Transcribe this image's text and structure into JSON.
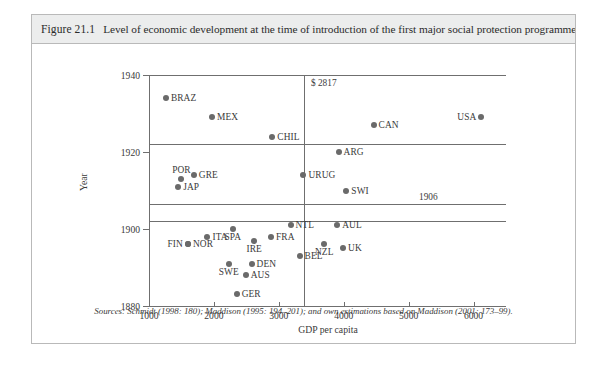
{
  "figure": {
    "number": "Figure 21.1",
    "caption": "Level of economic development at the time of introduction of the first major social protection programme",
    "source": "Sources: Schmidt (1998: 180); Maddison (1995: 194–201); and own estimations based on Maddison (2001: 173–99)."
  },
  "chart_data": {
    "type": "scatter",
    "title": "Level of economic development at the time of introduction of the first major social protection programme",
    "xlabel": "GDP per capita",
    "ylabel": "Year",
    "xlim": [
      1000,
      6500
    ],
    "ylim": [
      1880,
      1940
    ],
    "xticks": [
      1000,
      2000,
      3000,
      4000,
      5000,
      6000
    ],
    "xtick_labels": [
      "1000",
      "2000",
      "3000",
      "4000",
      "5000",
      "6000"
    ],
    "yticks": [
      1880,
      1900,
      1920,
      1940
    ],
    "ytick_labels": [
      "1880",
      "1900",
      "1920",
      "1940"
    ],
    "grid": false,
    "legend": "none",
    "reference_lines": [
      {
        "orientation": "vertical",
        "value": 2817,
        "label": "$ 2817"
      },
      {
        "orientation": "horizontal",
        "value": 1906,
        "label": "1906"
      },
      {
        "orientation": "horizontal",
        "value": 1920,
        "label": ""
      },
      {
        "orientation": "horizontal",
        "value": 1900,
        "label": ""
      },
      {
        "orientation": "horizontal",
        "value": 1940,
        "label": ""
      }
    ],
    "points": [
      {
        "name": "BRAZ",
        "x": 1260,
        "y": 1934,
        "label_pos": "right"
      },
      {
        "name": "MEX",
        "x": 1970,
        "y": 1929,
        "label_pos": "right"
      },
      {
        "name": "CHIL",
        "x": 2900,
        "y": 1924,
        "label_pos": "right"
      },
      {
        "name": "CAN",
        "x": 4460,
        "y": 1927,
        "label_pos": "right"
      },
      {
        "name": "USA",
        "x": 6120,
        "y": 1929,
        "label_pos": "left"
      },
      {
        "name": "ARG",
        "x": 3920,
        "y": 1920,
        "label_pos": "right"
      },
      {
        "name": "POR",
        "x": 1500,
        "y": 1913,
        "label_pos": "above"
      },
      {
        "name": "GRE",
        "x": 1690,
        "y": 1914,
        "label_pos": "right"
      },
      {
        "name": "JAP",
        "x": 1450,
        "y": 1911,
        "label_pos": "right"
      },
      {
        "name": "URUG",
        "x": 3380,
        "y": 1914,
        "label_pos": "right"
      },
      {
        "name": "SWI",
        "x": 4040,
        "y": 1910,
        "label_pos": "right"
      },
      {
        "name": "SPA",
        "x": 2290,
        "y": 1900,
        "label_pos": "below"
      },
      {
        "name": "ITA",
        "x": 1900,
        "y": 1898,
        "label_pos": "right"
      },
      {
        "name": "NOR",
        "x": 1600,
        "y": 1896,
        "label_pos": "right"
      },
      {
        "name": "FIN",
        "x": 1600,
        "y": 1896,
        "label_pos": "left"
      },
      {
        "name": "FRA",
        "x": 2880,
        "y": 1898,
        "label_pos": "right"
      },
      {
        "name": "IRE",
        "x": 2620,
        "y": 1897,
        "label_pos": "below"
      },
      {
        "name": "NTL",
        "x": 3180,
        "y": 1901,
        "label_pos": "right"
      },
      {
        "name": "AUL",
        "x": 3900,
        "y": 1901,
        "label_pos": "right"
      },
      {
        "name": "BEL",
        "x": 3320,
        "y": 1893,
        "label_pos": "right"
      },
      {
        "name": "NZL",
        "x": 3700,
        "y": 1896,
        "label_pos": "below"
      },
      {
        "name": "UK",
        "x": 3990,
        "y": 1895,
        "label_pos": "right"
      },
      {
        "name": "SWE",
        "x": 2230,
        "y": 1891,
        "label_pos": "below"
      },
      {
        "name": "DEN",
        "x": 2580,
        "y": 1891,
        "label_pos": "right"
      },
      {
        "name": "AUS",
        "x": 2490,
        "y": 1888,
        "label_pos": "right"
      },
      {
        "name": "GER",
        "x": 2350,
        "y": 1883,
        "label_pos": "right"
      }
    ]
  }
}
